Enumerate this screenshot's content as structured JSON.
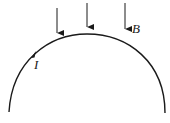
{
  "diagram": {
    "labels": {
      "current": "I",
      "field": "B"
    },
    "stroke_color": "#1a1a1a",
    "background": "#ffffff",
    "field_arrows": [
      {
        "x": 57,
        "y1": 8,
        "y2": 33
      },
      {
        "x": 87,
        "y1": 3,
        "y2": 27
      },
      {
        "x": 125,
        "y1": 3,
        "y2": 29
      }
    ],
    "wire": {
      "shape": "arc",
      "start": [
        9,
        112
      ],
      "apex": [
        87,
        34
      ],
      "end": [
        165,
        113
      ]
    }
  }
}
